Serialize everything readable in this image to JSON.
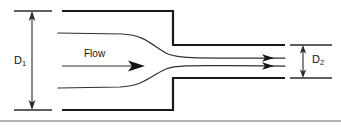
{
  "diagram": {
    "kind": "engineering-schematic",
    "canvas": {
      "width": 341,
      "height": 127,
      "background": "#ffffff"
    },
    "labels": {
      "upstream_diameter": "D",
      "upstream_diameter_subscript": "1",
      "downstream_diameter": "D",
      "downstream_diameter_subscript": "2",
      "flow": "Flow"
    },
    "colors": {
      "wall": "#1a1a1a",
      "streamline": "#303030",
      "dimension": "#2a2a2a",
      "baseline_rule": "#9a9a9a",
      "text": "#141414",
      "background": "#ffffff"
    },
    "geometry": {
      "large_pipe": {
        "top_wall_y": 11,
        "bottom_wall_y": 110,
        "x_start": 62,
        "x_step": 173
      },
      "small_pipe": {
        "top_wall_y": 45,
        "bottom_wall_y": 78,
        "x_start": 173,
        "x_end": 285
      },
      "dimension_d1": {
        "x": 32,
        "y_top": 11,
        "y_bottom": 110,
        "ext_x_start": 14,
        "ext_x_end": 52
      },
      "dimension_d2": {
        "x": 308,
        "y_top": 45,
        "y_bottom": 78,
        "ext_x_start": 290,
        "ext_x_end": 332
      },
      "flow_arrow": {
        "x_start": 62,
        "x_end": 140,
        "y": 66
      },
      "exit_arrows": [
        {
          "x_start": 185,
          "x_end": 272,
          "y": 58
        },
        {
          "x_start": 185,
          "x_end": 272,
          "y": 66
        }
      ],
      "baseline_rule_y": 121
    }
  }
}
